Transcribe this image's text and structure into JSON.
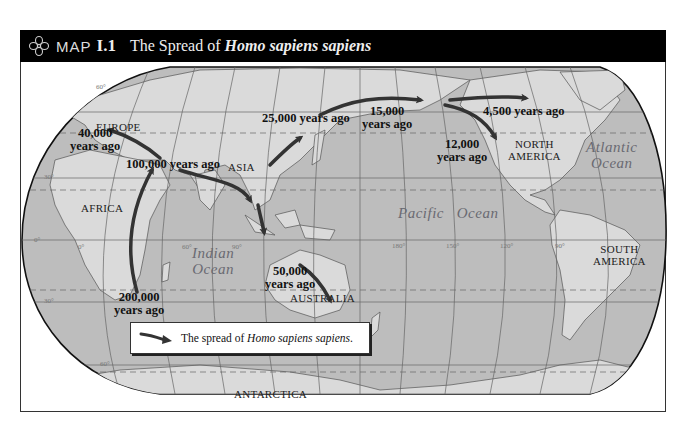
{
  "header": {
    "icon": "quatrefoil-ornament-icon",
    "map_word": "MAP",
    "map_number": "I.1",
    "title_prefix": "The Spread of ",
    "title_italic": "Homo sapiens sapiens"
  },
  "regions": {
    "europe": "EUROPE",
    "asia": "ASIA",
    "africa": "AFRICA",
    "australia": "AUSTRALIA",
    "north_america_1": "NORTH",
    "north_america_2": "AMERICA",
    "south_america_1": "SOUTH",
    "south_america_2": "AMERICA",
    "antarctica": "ANTARCTICA"
  },
  "oceans": {
    "indian_1": "Indian",
    "indian_2": "Ocean",
    "pacific_1": "Pacific",
    "pacific_2": "Ocean",
    "atlantic_1": "Atlantic",
    "atlantic_2": "Ocean"
  },
  "migration_labels": {
    "africa_origin_1": "200,000",
    "africa_origin_2": "years ago",
    "middle_east": "100,000 years ago",
    "europe_1": "40,000",
    "europe_2": "years ago",
    "australia_1": "50,000",
    "australia_2": "years ago",
    "east_asia": "25,000 years ago",
    "beringia_1": "15,000",
    "beringia_2": "years ago",
    "americas_1": "12,000",
    "americas_2": "years ago",
    "arctic": "4,500 years ago"
  },
  "graticule": {
    "lat_labels": [
      "60°",
      "30°",
      "0°",
      "30°",
      "60°"
    ],
    "lon_labels": [
      "0°",
      "60°",
      "90°",
      "180°",
      "150°",
      "120°",
      "90°"
    ]
  },
  "legend": {
    "arrow_icon": "migration-arrow-icon",
    "text_prefix": "The spread of ",
    "text_italic": "Homo sapiens sapiens",
    "text_suffix": "."
  },
  "colors": {
    "land": "#dadada",
    "ocean": "#bdbdbd",
    "arrow": "#3a3a3a",
    "header_bg": "#000000"
  }
}
